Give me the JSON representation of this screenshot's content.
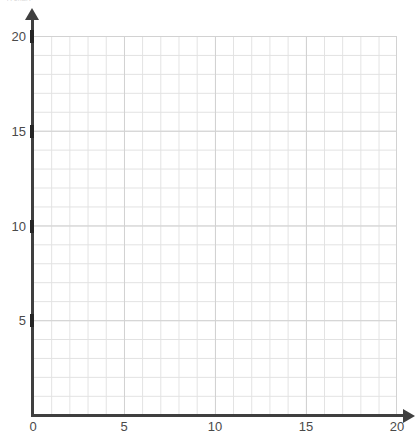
{
  "header": {
    "cropped_text": "A chart"
  },
  "chart_data": {
    "type": "scatter",
    "title": "",
    "xlabel": "",
    "ylabel": "",
    "xlim": [
      0,
      20
    ],
    "ylim": [
      0,
      20
    ],
    "grid": true,
    "minor_grid_step": 1,
    "major_grid_step": 5,
    "legend": null,
    "series": [],
    "x_ticks": [
      {
        "value": 0,
        "label": "0"
      },
      {
        "value": 5,
        "label": "5"
      },
      {
        "value": 10,
        "label": "10"
      },
      {
        "value": 15,
        "label": "15"
      },
      {
        "value": 20,
        "label": "20"
      }
    ],
    "y_ticks": [
      {
        "value": 5,
        "label": "5"
      },
      {
        "value": 10,
        "label": "10"
      },
      {
        "value": 15,
        "label": "15"
      },
      {
        "value": 20,
        "label": "20"
      }
    ],
    "annotations": []
  },
  "colors": {
    "axis": "#3f3f3f",
    "grid_minor": "#e2e2e2",
    "grid_major": "#d2d2d2",
    "tick_text": "#4a4a4a",
    "background": "#ffffff"
  }
}
